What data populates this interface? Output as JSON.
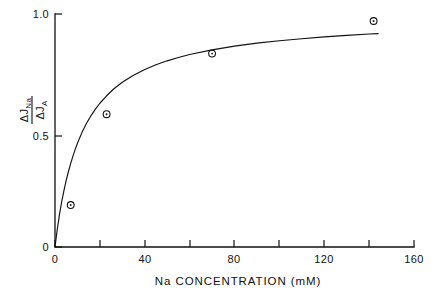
{
  "chart_data": {
    "type": "scatter",
    "title": "",
    "subtitle": "",
    "xlabel": "Na CONCENTRATION  (mM)",
    "ylabel": "ΔJ_Na / ΔJ_A",
    "ylabel_numerator": "ΔJ",
    "ylabel_numerator_sub": "Na",
    "ylabel_denominator": "ΔJ",
    "ylabel_denominator_sub": "A",
    "xlim": [
      0,
      160
    ],
    "ylim": [
      0,
      1.0
    ],
    "grid": false,
    "legend": null,
    "legend_position": "none",
    "x_major_ticks": [
      0,
      40,
      80,
      120,
      160
    ],
    "x_minor_ticks": [
      20,
      60,
      100,
      140
    ],
    "x_tick_labels": [
      "0",
      "40",
      "80",
      "120",
      "160"
    ],
    "y_major_ticks": [
      0,
      0.5,
      1.0
    ],
    "y_tick_labels": [
      "0",
      "0.5",
      "1.0"
    ],
    "x": [
      7,
      23,
      70,
      142
    ],
    "y": [
      0.18,
      0.57,
      0.83,
      0.97
    ],
    "series": [
      {
        "name": "Na flux ratio",
        "marker": "open-circle-with-dot",
        "points": [
          {
            "x": 7,
            "y": 0.18
          },
          {
            "x": 23,
            "y": 0.57
          },
          {
            "x": 70,
            "y": 0.83
          },
          {
            "x": 142,
            "y": 0.97
          }
        ]
      }
    ],
    "fit_curve": {
      "name": "saturation fit",
      "description": "hyperbolic saturation curve",
      "points": [
        {
          "x": 0.0,
          "y": 0.0
        },
        {
          "x": 1.0,
          "y": 0.075
        },
        {
          "x": 2.0,
          "y": 0.14
        },
        {
          "x": 3.0,
          "y": 0.195
        },
        {
          "x": 4.0,
          "y": 0.243
        },
        {
          "x": 5.0,
          "y": 0.286
        },
        {
          "x": 6.0,
          "y": 0.324
        },
        {
          "x": 7.0,
          "y": 0.359
        },
        {
          "x": 8.0,
          "y": 0.39
        },
        {
          "x": 9.0,
          "y": 0.419
        },
        {
          "x": 10.0,
          "y": 0.445
        },
        {
          "x": 12.0,
          "y": 0.491
        },
        {
          "x": 14.0,
          "y": 0.53
        },
        {
          "x": 16.0,
          "y": 0.563
        },
        {
          "x": 18.0,
          "y": 0.592
        },
        {
          "x": 20.0,
          "y": 0.617
        },
        {
          "x": 23.0,
          "y": 0.649
        },
        {
          "x": 26.0,
          "y": 0.677
        },
        {
          "x": 30.0,
          "y": 0.707
        },
        {
          "x": 35.0,
          "y": 0.737
        },
        {
          "x": 40.0,
          "y": 0.762
        },
        {
          "x": 45.0,
          "y": 0.782
        },
        {
          "x": 50.0,
          "y": 0.799
        },
        {
          "x": 55.0,
          "y": 0.813
        },
        {
          "x": 60.0,
          "y": 0.826
        },
        {
          "x": 70.0,
          "y": 0.846
        },
        {
          "x": 80.0,
          "y": 0.862
        },
        {
          "x": 90.0,
          "y": 0.875
        },
        {
          "x": 100.0,
          "y": 0.885
        },
        {
          "x": 110.0,
          "y": 0.894
        },
        {
          "x": 120.0,
          "y": 0.902
        },
        {
          "x": 130.0,
          "y": 0.908
        },
        {
          "x": 140.0,
          "y": 0.914
        },
        {
          "x": 144.0,
          "y": 0.916
        }
      ]
    },
    "colors": {
      "axis": "#111111",
      "curve": "#111111",
      "marker": "#111111",
      "background": "#ffffff"
    }
  }
}
